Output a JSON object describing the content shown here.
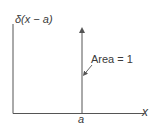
{
  "diagram": {
    "y_axis_label": "δ(x − a)",
    "x_axis_label": "x",
    "impulse_position_label": "a",
    "annotation": "Area = 1",
    "colors": {
      "line": "#555555",
      "text": "#3a3a3a",
      "background": "#ffffff"
    }
  }
}
